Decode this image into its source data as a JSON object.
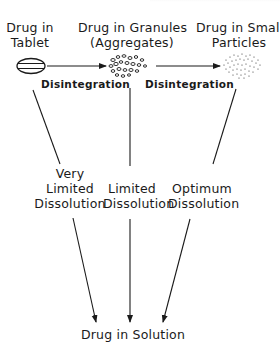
{
  "diagram": {
    "nodes": {
      "tablet": {
        "line1": "Drug in",
        "line2": "Tablet"
      },
      "granules": {
        "line1": "Drug in Granules",
        "line2": "(Aggregates)"
      },
      "particles": {
        "line1": "Drug in Small",
        "line2": "Particles"
      },
      "solution": {
        "label": "Drug in Solution"
      }
    },
    "edges": {
      "tablet_to_granules": {
        "label": "Disintegration"
      },
      "granules_to_particles": {
        "label": "Disintegration"
      },
      "tablet_to_solution": {
        "line1": "Very",
        "line2": "Limited",
        "line3": "Dissolution"
      },
      "granules_to_solution": {
        "line1": "Limited",
        "line2": "Dissolution"
      },
      "particles_to_solution": {
        "line1": "Optimum",
        "line2": "Dissolution"
      }
    },
    "colors": {
      "ink": "#1a1a1a",
      "background": "#ffffff"
    }
  }
}
